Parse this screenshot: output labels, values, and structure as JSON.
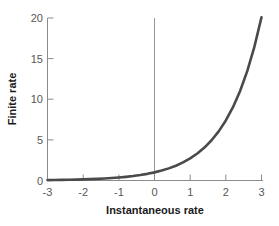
{
  "chart_data": {
    "type": "line",
    "title": "",
    "xlabel": "Instantaneous rate",
    "ylabel": "Finite rate",
    "xlim": [
      -3,
      3
    ],
    "ylim": [
      0,
      20
    ],
    "xticks": [
      -3,
      -2,
      -1,
      0,
      1,
      2,
      3
    ],
    "xtick_labels": [
      "-3",
      "-2",
      "-1",
      "0",
      "1",
      "2",
      "3"
    ],
    "yticks": [
      0,
      5,
      10,
      15,
      20
    ],
    "ytick_labels": [
      "0",
      "5",
      "10",
      "15",
      "20"
    ],
    "grid": false,
    "legend": null,
    "series": [
      {
        "name": "exponential",
        "function": "y = e^x",
        "color": "#4a4a4a",
        "line_width": 2.6,
        "x": [
          -3.0,
          -2.8,
          -2.6,
          -2.4,
          -2.2,
          -2.0,
          -1.8,
          -1.6,
          -1.4,
          -1.2,
          -1.0,
          -0.8,
          -0.6,
          -0.4,
          -0.2,
          0.0,
          0.2,
          0.4,
          0.6,
          0.8,
          1.0,
          1.2,
          1.4,
          1.6,
          1.8,
          2.0,
          2.2,
          2.4,
          2.6,
          2.8,
          3.0
        ],
        "y": [
          0.05,
          0.061,
          0.074,
          0.091,
          0.111,
          0.135,
          0.165,
          0.202,
          0.247,
          0.301,
          0.368,
          0.449,
          0.549,
          0.67,
          0.819,
          1.0,
          1.221,
          1.492,
          1.822,
          2.226,
          2.718,
          3.32,
          4.055,
          4.953,
          6.05,
          7.389,
          9.025,
          11.023,
          13.464,
          16.445,
          20.086
        ]
      }
    ],
    "reference_lines": [
      {
        "name": "vertical-zero-line",
        "orientation": "vertical",
        "value": 0,
        "color": "#8c8c8c"
      }
    ],
    "axis_color": "#8c8c8c",
    "tick_label_color": "#575757",
    "axis_title_color": "#1a1a1a",
    "background_color": "#ffffff"
  }
}
